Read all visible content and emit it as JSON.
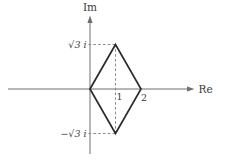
{
  "figure": {
    "axes": {
      "imaginary_label": "Im",
      "real_label": "Re"
    },
    "labels": {
      "top_vertex": "√3 i",
      "bottom_vertex": "−√3 i",
      "tick_1": "1",
      "tick_2": "2"
    },
    "shape": {
      "type": "rhombus",
      "vertices_complex": [
        "0",
        "1+√3 i",
        "2",
        "1−√3 i"
      ],
      "svg_points": "90,89 115.5,44.5 141,89 115.5,133.5"
    },
    "colors": {
      "background": "#ffffff",
      "axis": "#6f6f6f",
      "shape": "#2b2b2b",
      "dashed": "#7d7d7d",
      "text": "#3a3a3a"
    }
  }
}
